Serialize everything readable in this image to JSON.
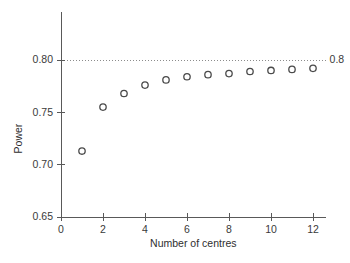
{
  "chart_data": {
    "type": "scatter",
    "title": "",
    "xlabel": "Number of centres",
    "ylabel": "Power",
    "x": [
      1,
      2,
      3,
      4,
      5,
      6,
      7,
      8,
      9,
      10,
      11,
      12
    ],
    "values": [
      0.713,
      0.755,
      0.768,
      0.776,
      0.781,
      0.784,
      0.786,
      0.787,
      0.789,
      0.79,
      0.791,
      0.792
    ],
    "series": [
      {
        "name": "Power",
        "values": [
          0.713,
          0.755,
          0.768,
          0.776,
          0.781,
          0.784,
          0.786,
          0.787,
          0.789,
          0.79,
          0.791,
          0.792
        ]
      }
    ],
    "xlim": [
      0,
      12.6
    ],
    "ylim": [
      0.65,
      0.825
    ],
    "xticks": [
      0,
      2,
      4,
      6,
      8,
      10,
      12
    ],
    "xtick_labels": [
      "0",
      "2",
      "4",
      "6",
      "8",
      "10",
      "12"
    ],
    "yticks": [
      0.65,
      0.7,
      0.75,
      0.8
    ],
    "ytick_labels": [
      "0.65",
      "0.70",
      "0.75",
      "0.80"
    ],
    "grid": false,
    "legend": null,
    "marker": "open-circle",
    "annotations": [
      {
        "name": "target-power-line",
        "type": "hline",
        "y": 0.8,
        "label": "0.8",
        "style": "dotted"
      }
    ],
    "colors": {
      "marker_stroke": "#4a4a4a",
      "axis": "#595959",
      "reference_line": "#8c8c8c",
      "background": "#ffffff",
      "text": "#3a3a3a"
    }
  }
}
